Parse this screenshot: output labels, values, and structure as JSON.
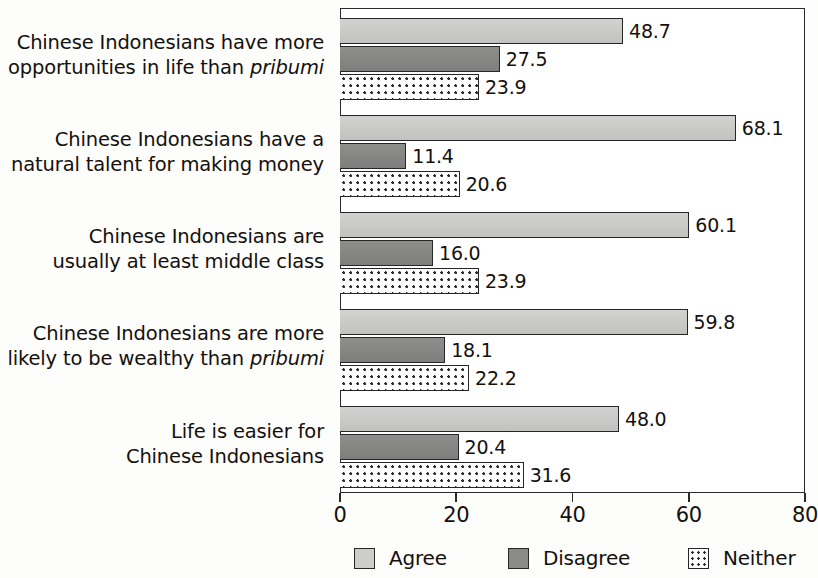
{
  "chart_data": {
    "type": "bar",
    "orientation": "horizontal",
    "title": "",
    "xlabel": "",
    "ylabel": "",
    "xlim": [
      0,
      80
    ],
    "xticks": [
      0,
      20,
      40,
      60,
      80
    ],
    "grid": false,
    "legend_position": "bottom",
    "categories": [
      "Chinese Indonesians have more opportunities in life than pribumi",
      "Chinese Indonesians have a natural talent for making money",
      "Chinese Indonesians are usually at least middle class",
      "Chinese Indonesians are more likely to be wealthy than pribumi",
      "Life is easier for Chinese Indonesians"
    ],
    "series": [
      {
        "name": "Agree",
        "color": "#cdcdcb",
        "values": [
          48.7,
          68.1,
          60.1,
          59.8,
          48.0
        ]
      },
      {
        "name": "Disagree",
        "color": "#8a8a88",
        "values": [
          27.5,
          11.4,
          16.0,
          18.1,
          20.4
        ]
      },
      {
        "name": "Neither",
        "color": "#ffffff",
        "values": [
          23.9,
          20.6,
          23.9,
          22.2,
          31.6
        ]
      }
    ]
  },
  "category_labels": [
    {
      "line1": "Chinese Indonesians have more",
      "line2_pre": "opportunities in life than ",
      "line2_em": "pribumi",
      "line2_post": ""
    },
    {
      "line1": "Chinese Indonesians have a",
      "line2_pre": "natural talent for making money",
      "line2_em": "",
      "line2_post": ""
    },
    {
      "line1": "Chinese Indonesians are",
      "line2_pre": "usually at least middle class",
      "line2_em": "",
      "line2_post": ""
    },
    {
      "line1": "Chinese Indonesians are more",
      "line2_pre": "likely to be wealthy than ",
      "line2_em": "pribumi",
      "line2_post": ""
    },
    {
      "line1": "Life is easier for",
      "line2_pre": "Chinese Indonesians",
      "line2_em": "",
      "line2_post": ""
    }
  ],
  "value_labels": {
    "g0": [
      "48.7",
      "27.5",
      "23.9"
    ],
    "g1": [
      "68.1",
      "11.4",
      "20.6"
    ],
    "g2": [
      "60.1",
      "16.0",
      "23.9"
    ],
    "g3": [
      "59.8",
      "18.1",
      "22.2"
    ],
    "g4": [
      "48.0",
      "20.4",
      "31.6"
    ]
  },
  "axis": {
    "tick_labels": [
      "0",
      "20",
      "40",
      "60",
      "80"
    ]
  },
  "legend": {
    "items": [
      {
        "label": "Agree",
        "swatch": "agree"
      },
      {
        "label": "Disagree",
        "swatch": "disagree"
      },
      {
        "label": "Neither",
        "swatch": "neither"
      }
    ]
  }
}
